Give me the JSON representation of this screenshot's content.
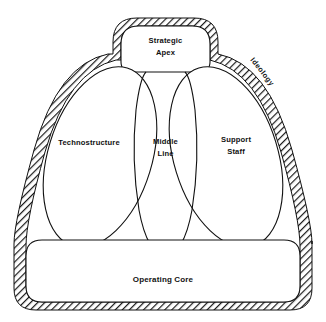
{
  "diagram": {
    "type": "organizational-structure-diagram",
    "background_color": "#ffffff",
    "line_color": "#111111",
    "hatch_color": "#1a1a1a",
    "parts": {
      "strategic_apex": {
        "label_line1": "Strategic",
        "label_line2": "Apex",
        "shape": "rounded-rectangle",
        "position": "top-center"
      },
      "technostructure": {
        "label": "Technostructure",
        "shape": "tilted-ellipse",
        "position": "left-wing"
      },
      "middle_line": {
        "label_line1": "Middle",
        "label_line2": "Line",
        "shape": "vertical-channel",
        "position": "center"
      },
      "support_staff": {
        "label_line1": "Support",
        "label_line2": "Staff",
        "shape": "tilted-ellipse",
        "position": "right-wing"
      },
      "operating_core": {
        "label": "Operating Core",
        "shape": "rounded-rectangle",
        "position": "bottom-wide"
      },
      "ideology": {
        "label": "Ideology",
        "shape": "hatched-outer-shell",
        "position": "outer-border-right",
        "rotation_deg": 52
      }
    }
  }
}
